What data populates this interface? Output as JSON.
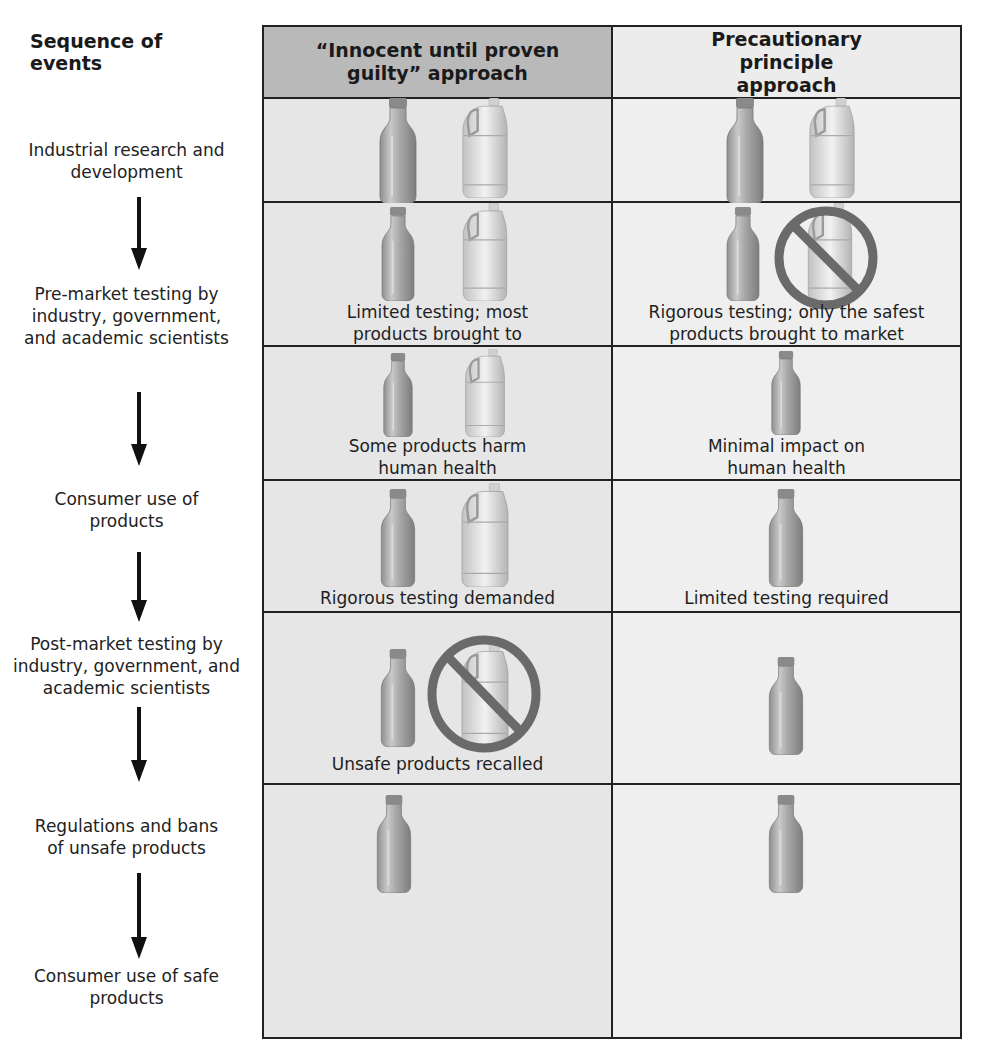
{
  "sequence": {
    "title": "Sequence of events",
    "steps": [
      "Industrial research and development",
      "Pre-market testing by industry, government, and academic scientists",
      "Consumer use of products",
      "Post-market testing by industry, government, and academic scientists",
      "Regulations and bans of unsafe products",
      "Consumer use of safe products"
    ]
  },
  "columns": {
    "innocent": "“Innocent until proven guilty” approach",
    "precautionary": "Precautionary principle approach"
  },
  "rows": [
    {
      "innocent": {
        "caption": "",
        "products": [
          "bottle",
          "jug"
        ],
        "banned": false
      },
      "precautionary": {
        "caption": "",
        "products": [
          "bottle",
          "jug"
        ],
        "banned": false
      }
    },
    {
      "innocent": {
        "caption": "Limited testing; most products brought to market",
        "products": [
          "bottle",
          "jug"
        ],
        "banned": false
      },
      "precautionary": {
        "caption": "Rigorous testing; only the safest products brought to market",
        "products": [
          "bottle",
          "jug"
        ],
        "banned": true
      }
    },
    {
      "innocent": {
        "caption": "Some products harm human health",
        "products": [
          "bottle",
          "jug"
        ],
        "banned": false
      },
      "precautionary": {
        "caption": "Minimal impact on human health",
        "products": [
          "bottle"
        ],
        "banned": false
      }
    },
    {
      "innocent": {
        "caption": "Rigorous testing demanded",
        "products": [
          "bottle",
          "jug"
        ],
        "banned": false
      },
      "precautionary": {
        "caption": "Limited testing required",
        "products": [
          "bottle"
        ],
        "banned": false
      }
    },
    {
      "innocent": {
        "caption": "Unsafe products recalled",
        "products": [
          "bottle",
          "jug"
        ],
        "banned": true
      },
      "precautionary": {
        "caption": "",
        "products": [
          "bottle"
        ],
        "banned": false
      }
    },
    {
      "innocent": {
        "caption": "",
        "products": [
          "bottle"
        ],
        "banned": false
      },
      "precautionary": {
        "caption": "",
        "products": [
          "bottle"
        ],
        "banned": false
      }
    }
  ],
  "colors": {
    "header_left_bg": "#b9b9b9",
    "header_right_bg": "#ececec",
    "ban_symbol": "#6a6a6a",
    "grid_line": "#222222"
  }
}
